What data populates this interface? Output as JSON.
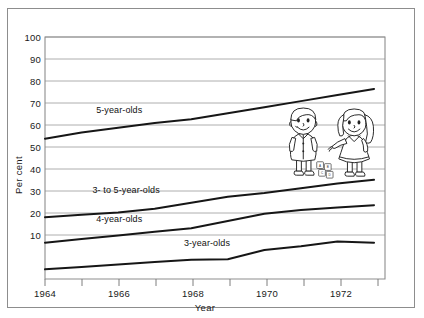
{
  "chart_data": {
    "type": "line",
    "title": "",
    "xlabel": "Year",
    "ylabel": "Per cent",
    "xlim": [
      1964,
      1973.3
    ],
    "ylim": [
      0,
      100
    ],
    "grid": true,
    "legend_position": "inline-labels",
    "x_tick_labels": [
      "1964",
      "1966",
      "1968",
      "1970",
      "1972"
    ],
    "x_tick_values": [
      1964,
      1966,
      1968,
      1970,
      1972
    ],
    "x_minor_ticks": [
      1965,
      1967,
      1969,
      1971,
      1973
    ],
    "y_tick_labels": [
      "10",
      "20",
      "30",
      "40",
      "50",
      "60",
      "70",
      "80",
      "90",
      "100"
    ],
    "y_tick_values": [
      10,
      20,
      30,
      40,
      50,
      60,
      70,
      80,
      90,
      100
    ],
    "x": [
      1964,
      1965,
      1966,
      1967,
      1968,
      1969,
      1970,
      1971,
      1972,
      1973
    ],
    "series": [
      {
        "name": "5-year-olds",
        "label": "5-year-olds",
        "values": [
          58,
          60.5,
          62.5,
          64.5,
          66,
          68.5,
          71,
          73.5,
          76,
          78.5
        ],
        "label_x": 1965.4,
        "label_y": 68.5
      },
      {
        "name": "3- to 5-year-olds",
        "label": "3- to 5-year-olds",
        "values": [
          25.5,
          26.5,
          27.5,
          29,
          31.5,
          34,
          35.5,
          37.5,
          39.5,
          41
        ],
        "label_x": 1965.3,
        "label_y": 35.5
      },
      {
        "name": "4-year-olds",
        "label": "4-year-olds",
        "values": [
          15,
          16.5,
          18,
          19.5,
          21,
          24,
          27,
          28.5,
          29.5,
          30.5
        ],
        "label_x": 1965.4,
        "label_y": 23.5
      },
      {
        "name": "3-year-olds",
        "label": "3-year-olds",
        "values": [
          4,
          5,
          6,
          7,
          8,
          8.2,
          12,
          13.5,
          15.5,
          15
        ],
        "label_x": 1967.8,
        "label_y": 13.5
      }
    ],
    "annotations": [
      {
        "name": "children-illustration",
        "description": "Two cartoon children playing with alphabet blocks",
        "block_letters": [
          "A",
          "B",
          "C",
          "D"
        ]
      }
    ]
  }
}
